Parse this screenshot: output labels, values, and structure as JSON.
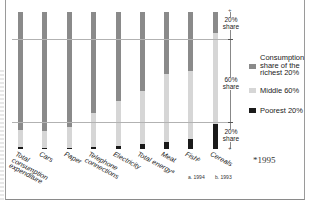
{
  "chart_data": {
    "type": "bar",
    "stacked": true,
    "orientation": "vertical",
    "title": "",
    "xlabel": "",
    "ylabel": "",
    "ylim": [
      0,
      100
    ],
    "grid": false,
    "reference_lines": [
      20,
      80
    ],
    "categories": [
      "Total consumption expenditure",
      "Cars",
      "Paper",
      "Telephone connections",
      "Electricity",
      "Total energy*",
      "Meat",
      "Fish b",
      "Cereals b"
    ],
    "series": [
      {
        "name": "Poorest 20%",
        "color": "#1a1a1a",
        "values": [
          1.3,
          0.6,
          1.0,
          1.5,
          2.0,
          4.0,
          5.0,
          7.0,
          18.0
        ]
      },
      {
        "name": "Middle 60%",
        "color": "#d6d6d6",
        "values": [
          12.7,
          12.4,
          15.0,
          24.5,
          33.0,
          38.0,
          50.0,
          50.0,
          67.0
        ]
      },
      {
        "name": "Consumption share of the richest 20%",
        "color": "#8a8a8a",
        "values": [
          86.0,
          87.0,
          84.0,
          74.0,
          65.0,
          58.0,
          45.0,
          43.0,
          15.0
        ]
      }
    ],
    "legend_position": "right",
    "annotations": [
      "20% share",
      "60% share",
      "20% share",
      "*1995",
      "a. 1994",
      "b. 1993"
    ]
  },
  "labels": [
    "Total\nconsumption\nexpenditure",
    "Cars",
    "Paper",
    "Telephone\nconnections",
    "Electricity",
    "Total energyᵃ",
    "Meat",
    "Fishᵇ",
    "Cereals"
  ],
  "scale": {
    "top_share": "20%\nshare",
    "middle_share": "60%\nshare",
    "bottom_share": "20%\nshare"
  },
  "legend": {
    "rich": "Consumption\nshare of the\nrichest 20%",
    "middle": "Middle 60%",
    "poor": "Poorest 20%"
  },
  "footnotes": {
    "a": "a. 1994",
    "b": "b. 1993",
    "star": "*1995"
  },
  "colors": {
    "rich": "#8a8a8a",
    "middle": "#d6d6d6",
    "poor": "#1a1a1a",
    "reference_line": "#b2b2b2"
  }
}
